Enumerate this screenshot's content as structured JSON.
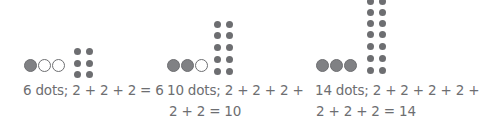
{
  "figures": [
    {
      "circles": [
        "filled",
        "empty",
        "empty"
      ],
      "dot_rows": 3,
      "dot_count": 6,
      "caption_lines": [
        "6 dots; 2 + 2 + 2 = 6"
      ]
    },
    {
      "circles": [
        "filled",
        "filled",
        "empty"
      ],
      "dot_rows": 5,
      "dot_count": 10,
      "caption_lines": [
        "10 dots; 2 + 2 + 2 +",
        "2 + 2 = 10"
      ]
    },
    {
      "circles": [
        "filled",
        "filled",
        "filled"
      ],
      "dot_rows": 7,
      "dot_count": 14,
      "caption_lines": [
        "14 dots; 2 + 2 + 2 + 2 +",
        "2 + 2 + 2 = 14"
      ]
    }
  ],
  "colors": {
    "ink": "#6d6e71",
    "fill": "#808184"
  }
}
